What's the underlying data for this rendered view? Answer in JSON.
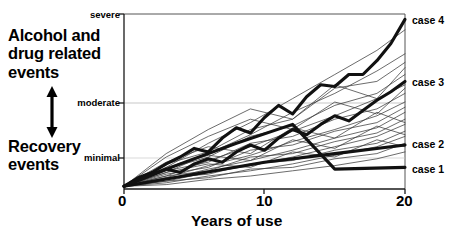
{
  "figure": {
    "title_left_top": "Alcohol and\ndrug related\nevents",
    "title_left_top_lines": [
      "Alcohol and",
      "drug related",
      "events"
    ],
    "title_left_bottom_lines": [
      "Recovery",
      "events"
    ],
    "arrow": "double-headed-vertical-arrow"
  },
  "chart_data": {
    "type": "line",
    "title": "",
    "xlabel": "Years of use",
    "ylabel": "",
    "xlim": [
      0,
      20
    ],
    "ylim": [
      0,
      100
    ],
    "xticks": [
      0,
      10,
      20
    ],
    "xticklabels": [
      "0",
      "10",
      "20"
    ],
    "yticklabels": [
      "minimal",
      "moderate",
      "severe"
    ],
    "ytickvalues": [
      18,
      55,
      96
    ],
    "grid": false,
    "legend_position": "right-end-of-line",
    "annotations": [
      {
        "text": "Alcohol and drug related events",
        "position": "upper-left",
        "arrow": "up"
      },
      {
        "text": "Recovery events",
        "position": "lower-left",
        "arrow": "down"
      }
    ],
    "series": [
      {
        "name": "case 4",
        "emphasis": "bold",
        "label": "case 4",
        "x": [
          0,
          1,
          2,
          3,
          4,
          5,
          6,
          7,
          8,
          9,
          10,
          11,
          12,
          13,
          14,
          15,
          16,
          17,
          18,
          19,
          20
        ],
        "y": [
          1,
          6,
          9,
          14,
          18,
          23,
          21,
          29,
          35,
          32,
          41,
          48,
          43,
          53,
          60,
          59,
          66,
          66,
          74,
          84,
          98
        ]
      },
      {
        "name": "case 3",
        "emphasis": "bold",
        "label": "case 3",
        "x": [
          0,
          1,
          2,
          3,
          4,
          5,
          6,
          7,
          8,
          9,
          10,
          11,
          12,
          13,
          14,
          15,
          16,
          17,
          18,
          19,
          20
        ],
        "y": [
          1,
          5,
          8,
          11,
          9,
          14,
          17,
          15,
          21,
          25,
          22,
          29,
          34,
          31,
          37,
          42,
          39,
          45,
          51,
          56,
          62
        ]
      },
      {
        "name": "case 2",
        "emphasis": "bold",
        "label": "case 2",
        "x": [
          0,
          5,
          10,
          15,
          20
        ],
        "y": [
          1,
          8,
          15,
          20,
          25
        ]
      },
      {
        "name": "case 1",
        "emphasis": "bold",
        "label": "case 1",
        "x": [
          0,
          4,
          8,
          12,
          15,
          20
        ],
        "y": [
          1,
          14,
          26,
          37,
          11,
          12
        ]
      },
      {
        "name": "background trajectory 1",
        "emphasis": "thin",
        "label": "",
        "x": [
          0,
          3,
          6,
          9,
          12,
          15,
          18,
          20
        ],
        "y": [
          1,
          12,
          26,
          38,
          52,
          66,
          80,
          92
        ]
      },
      {
        "name": "background trajectory 2",
        "emphasis": "thin",
        "label": "",
        "x": [
          0,
          3,
          6,
          9,
          12,
          15,
          18,
          20
        ],
        "y": [
          1,
          9,
          20,
          31,
          44,
          55,
          68,
          78
        ]
      },
      {
        "name": "background trajectory 3",
        "emphasis": "thin",
        "label": "",
        "x": [
          0,
          3,
          6,
          9,
          12,
          15,
          18,
          20
        ],
        "y": [
          1,
          14,
          21,
          34,
          40,
          58,
          62,
          73
        ]
      },
      {
        "name": "background trajectory 4",
        "emphasis": "thin",
        "label": "",
        "x": [
          0,
          3,
          6,
          9,
          12,
          15,
          18,
          20
        ],
        "y": [
          1,
          7,
          16,
          24,
          33,
          42,
          52,
          60
        ]
      },
      {
        "name": "background trajectory 5",
        "emphasis": "thin",
        "label": "",
        "x": [
          0,
          3,
          6,
          9,
          12,
          15,
          18,
          20
        ],
        "y": [
          1,
          11,
          18,
          30,
          36,
          48,
          55,
          66
        ]
      },
      {
        "name": "background trajectory 6",
        "emphasis": "thin",
        "label": "",
        "x": [
          0,
          3,
          6,
          9,
          12,
          15,
          18,
          20
        ],
        "y": [
          1,
          6,
          13,
          19,
          27,
          34,
          42,
          50
        ]
      },
      {
        "name": "background trajectory 7",
        "emphasis": "thin",
        "label": "",
        "x": [
          0,
          3,
          6,
          9,
          12,
          15,
          18,
          20
        ],
        "y": [
          1,
          10,
          15,
          26,
          30,
          40,
          46,
          55
        ]
      },
      {
        "name": "background trajectory 8",
        "emphasis": "thin",
        "label": "",
        "x": [
          0,
          3,
          6,
          9,
          12,
          15,
          18,
          20
        ],
        "y": [
          1,
          5,
          11,
          16,
          22,
          29,
          35,
          44
        ]
      },
      {
        "name": "background trajectory 9",
        "emphasis": "thin",
        "label": "",
        "x": [
          0,
          3,
          6,
          9,
          12,
          15,
          18,
          20
        ],
        "y": [
          1,
          8,
          12,
          22,
          25,
          33,
          38,
          47
        ]
      },
      {
        "name": "background trajectory 10",
        "emphasis": "thin",
        "label": "",
        "x": [
          0,
          3,
          6,
          9,
          12,
          15,
          18,
          20
        ],
        "y": [
          1,
          4,
          9,
          13,
          18,
          24,
          30,
          37
        ]
      },
      {
        "name": "background trajectory 11",
        "emphasis": "thin",
        "label": "",
        "x": [
          0,
          3,
          6,
          9,
          12,
          15,
          18,
          20
        ],
        "y": [
          1,
          7,
          10,
          18,
          20,
          27,
          32,
          40
        ]
      },
      {
        "name": "background trajectory 12",
        "emphasis": "thin",
        "label": "",
        "x": [
          0,
          3,
          6,
          9,
          12,
          15,
          18,
          20
        ],
        "y": [
          1,
          3,
          7,
          10,
          14,
          19,
          24,
          30
        ]
      },
      {
        "name": "background trajectory 13",
        "emphasis": "thin",
        "label": "",
        "x": [
          0,
          3,
          6,
          9,
          12,
          15,
          18,
          20
        ],
        "y": [
          1,
          6,
          8,
          14,
          16,
          22,
          26,
          33
        ]
      },
      {
        "name": "background trajectory 14",
        "emphasis": "thin",
        "label": "",
        "x": [
          0,
          3,
          6,
          9,
          12,
          15,
          18,
          20
        ],
        "y": [
          1,
          9,
          14,
          12,
          21,
          18,
          28,
          24
        ]
      },
      {
        "name": "background trajectory 15",
        "emphasis": "thin",
        "label": "",
        "x": [
          0,
          3,
          6,
          9,
          12,
          15,
          18,
          20
        ],
        "y": [
          1,
          12,
          19,
          16,
          28,
          23,
          36,
          31
        ]
      },
      {
        "name": "background trajectory 16",
        "emphasis": "thin",
        "label": "",
        "x": [
          0,
          3,
          6,
          9,
          12,
          15,
          18,
          20
        ],
        "y": [
          1,
          15,
          24,
          20,
          35,
          29,
          44,
          38
        ]
      },
      {
        "name": "background trajectory 17",
        "emphasis": "thin",
        "label": "",
        "x": [
          0,
          3,
          6,
          9,
          12,
          15,
          18,
          20
        ],
        "y": [
          1,
          18,
          30,
          40,
          34,
          50,
          43,
          58
        ]
      },
      {
        "name": "background trajectory 18",
        "emphasis": "thin",
        "label": "",
        "x": [
          0,
          3,
          6,
          9,
          12,
          15,
          18,
          20
        ],
        "y": [
          1,
          20,
          34,
          46,
          40,
          60,
          52,
          70
        ]
      },
      {
        "name": "background trajectory 19",
        "emphasis": "thin",
        "label": "",
        "x": [
          0,
          3,
          6,
          9,
          12,
          15,
          18,
          20
        ],
        "y": [
          1,
          2,
          5,
          7,
          10,
          13,
          17,
          21
        ]
      },
      {
        "name": "background trajectory 20",
        "emphasis": "thin",
        "label": "",
        "x": [
          0,
          3,
          6,
          9,
          12,
          15,
          18,
          20
        ],
        "y": [
          1,
          4,
          6,
          11,
          12,
          17,
          20,
          26
        ]
      }
    ]
  }
}
